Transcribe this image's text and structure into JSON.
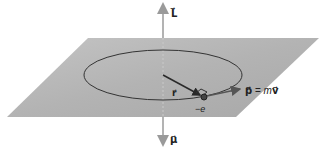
{
  "diagram": {
    "labels": {
      "angular_momentum": "L⃗",
      "magnetic_moment": "μ⃗",
      "radius_vector": "r⃗",
      "electron_charge": "−e",
      "momentum_lhs": "p⃗",
      "momentum_eq": " = ",
      "momentum_m": "m",
      "momentum_v": "v⃗"
    },
    "colors": {
      "plane": "#b5b5b5",
      "axis": "#9a9a9a",
      "orbit": "#333333",
      "vector": "#2a2a2a",
      "momentum_arrow": "#555555"
    }
  }
}
